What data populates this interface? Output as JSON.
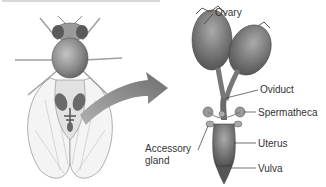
{
  "diagram": {
    "labels": {
      "ovary": "Ovary",
      "oviduct": "Oviduct",
      "spermatheca": "Spermatheca",
      "accessory_gland_line1": "Accessory",
      "accessory_gland_line2": "gland",
      "uterus": "Uterus",
      "vulva": "Vulva"
    },
    "colors": {
      "organ_dark": "#5e5e5e",
      "organ_mid": "#8a8a8a",
      "organ_light": "#b8b8b8",
      "arrow": "#7a7a7a",
      "leader_line": "#333333",
      "text": "#333333"
    }
  }
}
